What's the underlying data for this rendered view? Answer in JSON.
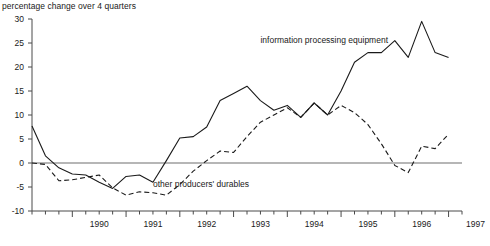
{
  "chart_data": {
    "type": "line",
    "title": "",
    "subtitle": "",
    "ylabel": "percentage change over 4 quarters",
    "xlabel": "",
    "ylim": [
      -10,
      30
    ],
    "yticks": [
      -10,
      -5,
      0,
      5,
      10,
      15,
      20,
      25,
      30
    ],
    "ytick_labels": [
      "-10",
      "-5",
      "0",
      "5",
      "10",
      "15",
      "20",
      "25",
      "30"
    ],
    "xlim": [
      1989.25,
      1997.25
    ],
    "xtick_labels": [
      "1990",
      "1991",
      "1992",
      "1993",
      "1994",
      "1995",
      "1996",
      "1997"
    ],
    "xtick_values": [
      1990.0,
      1991.0,
      1992.0,
      1993.0,
      1994.0,
      1995.0,
      1996.0,
      1997.0
    ],
    "minor_tick_interval": 0.25,
    "grid": false,
    "zero_line": 0,
    "legend": "inline-annotations",
    "annotations": [
      {
        "text": "information processing equipment",
        "x": 1993.5,
        "y": 25.5
      },
      {
        "text": "other producers' durables",
        "x": 1991.5,
        "y": -4.5
      }
    ],
    "x": [
      1989.25,
      1989.5,
      1989.75,
      1990.0,
      1990.25,
      1990.5,
      1990.75,
      1991.0,
      1991.25,
      1991.5,
      1991.75,
      1992.0,
      1992.25,
      1992.5,
      1992.75,
      1993.0,
      1993.25,
      1993.5,
      1993.75,
      1994.0,
      1994.25,
      1994.5,
      1994.75,
      1995.0,
      1995.25,
      1995.5,
      1995.75,
      1996.0,
      1996.25,
      1996.5,
      1996.75,
      1997.0
    ],
    "series": [
      {
        "name": "information processing equipment",
        "style": "solid",
        "color": "#1a1a1a",
        "values": [
          7.7,
          1.5,
          -1.0,
          -2.3,
          -2.5,
          -4.0,
          -5.3,
          -2.8,
          -2.5,
          -4.0,
          0.5,
          5.2,
          5.5,
          7.5,
          13.0,
          14.5,
          16.0,
          13.0,
          11.0,
          12.0,
          9.5,
          12.5,
          10.0,
          15.0,
          21.0,
          23.0,
          23.0,
          25.5,
          22.0,
          29.5,
          23.0,
          22.0
        ]
      },
      {
        "name": "other producers' durables",
        "style": "dashed",
        "color": "#1a1a1a",
        "values": [
          0.0,
          -0.3,
          -3.7,
          -3.5,
          -3.0,
          -2.5,
          -5.2,
          -6.7,
          -6.0,
          -6.2,
          -6.7,
          -4.5,
          -1.7,
          0.5,
          2.5,
          2.2,
          5.5,
          8.5,
          10.0,
          11.5,
          9.5,
          12.5,
          10.0,
          12.0,
          10.5,
          8.0,
          4.0,
          -0.5,
          -2.0,
          3.5,
          3.0,
          6.0
        ]
      }
    ]
  }
}
